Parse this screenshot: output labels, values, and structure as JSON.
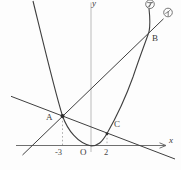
{
  "figure": {
    "type": "math-graph",
    "colors": {
      "background": "#fdfdfd",
      "ink": "#3f3f3f",
      "x_axis": "#5f5f5f",
      "y_axis": "#b3b3b3",
      "guide": "#999999",
      "tag_ring": "#555555"
    },
    "axes": {
      "x_label": "x",
      "y_label": "y",
      "origin_label": "O"
    },
    "x_ticks": [
      {
        "label": "-3",
        "value": -3
      },
      {
        "label": "2",
        "value": 2
      }
    ],
    "points": [
      {
        "label": "A",
        "note": "intersection of parabola and both lines, above x = -3"
      },
      {
        "label": "B",
        "note": "intersection of parabola and line イ, upper right"
      },
      {
        "label": "C",
        "note": "intersection of parabola and descending line, above x = 2"
      }
    ],
    "curves": [
      {
        "name": "parabola",
        "tag": "ア",
        "style": "upward parabola, vertex at origin"
      },
      {
        "name": "line-AB",
        "tag": "イ",
        "style": "positive-slope line through A and B"
      },
      {
        "name": "line-AC",
        "tag": "",
        "style": "negative-slope line through A and C"
      }
    ]
  }
}
